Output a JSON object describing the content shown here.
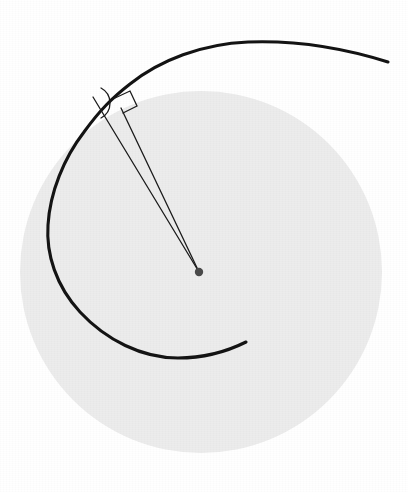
{
  "figure": {
    "title": "Archimedean spiral inscribed over a shaded disk with tangent and normal construction lines",
    "domain_label": "geometry-diagram",
    "canvas": {
      "width": 408,
      "height": 492,
      "background_color": "#ffffff"
    },
    "colors": {
      "background": "#ffffff",
      "disk_fill": "#ececec",
      "spiral_stroke": "#141414",
      "thin_line_stroke": "#1c1c1c",
      "marker_stroke": "#1c1c1c",
      "center_dot_fill": "#4a4a4a"
    }
  },
  "chart_data": {
    "type": "line",
    "title": "Archimedean spiral inscribed over a shaded disk",
    "subtitle": "",
    "xlabel": "",
    "ylabel": "",
    "grid": false,
    "legend_position": "none",
    "coordinate_system": "pixel, origin top-left, y increases downward",
    "xlim": [
      0,
      408
    ],
    "ylim": [
      0,
      492
    ],
    "annotations": [
      "angle-arc marker at spiral-line intersection",
      "right-angle square marker on second radial line"
    ]
  },
  "disk": {
    "name": "shaded-disk",
    "center_x": 201,
    "center_y": 272,
    "radius": 181,
    "fill": "#ececec",
    "stroke": "none"
  },
  "spiral": {
    "name": "archimedean-spiral",
    "stroke": "#141414",
    "stroke_width": 3.1,
    "direction": "counterclockwise outward",
    "inner_end_x": 246,
    "inner_end_y": 342,
    "outer_end_x": 388,
    "outer_end_y": 62,
    "turn_sweep_degrees": 352,
    "path": "M 246 342 C 230 350, 205 358, 178 358 C 142 358, 106 340, 80 312 C 56 286, 46 254, 48 225 C 50 192, 64 158, 84 132 C 100 110, 112 98, 130 84 C 160 60, 202 44, 248 42 C 300 40, 350 50, 388 62"
  },
  "radial_lines": [
    {
      "name": "tangent-construction-line",
      "x1": 93,
      "y1": 97,
      "x2": 199,
      "y2": 272,
      "stroke_width": 1.3
    },
    {
      "name": "normal-construction-line",
      "x1": 121,
      "y1": 108,
      "x2": 199,
      "y2": 272,
      "stroke_width": 1.3
    }
  ],
  "markers": {
    "angle_arc": {
      "name": "angle-arc-marker",
      "stroke_width": 1.3,
      "path": "M 101 88 A 17 17 0 0 1 101 118"
    },
    "right_angle_square": {
      "name": "right-angle-marker",
      "stroke_width": 1.3,
      "path": "M 115 98 L 130 91 L 137 106 L 123 113"
    }
  },
  "center_point": {
    "name": "spiral-center-point",
    "x": 199,
    "y": 272,
    "radius": 4.2,
    "fill": "#4a4a4a"
  }
}
